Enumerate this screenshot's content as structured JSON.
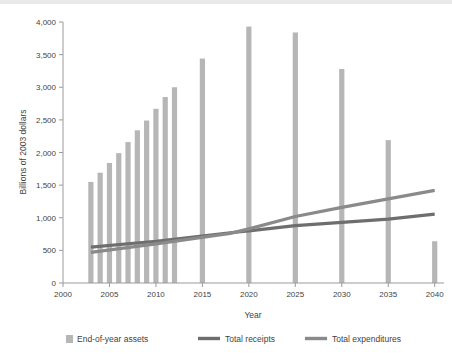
{
  "chart_data": {
    "type": "bar",
    "title": "",
    "xlabel": "Year",
    "ylabel": "Billions of 2003 dollars",
    "xlim": [
      2000,
      2041
    ],
    "ylim": [
      0,
      4000
    ],
    "grid": false,
    "legend_position": "bottom",
    "x_ticks": [
      "2000",
      "2005",
      "2010",
      "2015",
      "2020",
      "2025",
      "2030",
      "2035",
      "2040"
    ],
    "x_tick_values": [
      2000,
      2005,
      2010,
      2015,
      2020,
      2025,
      2030,
      2035,
      2040
    ],
    "y_ticks": [
      "0",
      "500",
      "1,000",
      "1,500",
      "2,000",
      "2,500",
      "3,000",
      "3,500",
      "4,000"
    ],
    "y_tick_values": [
      0,
      500,
      1000,
      1500,
      2000,
      2500,
      3000,
      3500,
      4000
    ],
    "series": [
      {
        "name": "End-of-year assets",
        "type": "bar",
        "color": "#b6b6b6",
        "x": [
          2003,
          2004,
          2005,
          2006,
          2007,
          2008,
          2009,
          2010,
          2011,
          2012,
          2015,
          2020,
          2025,
          2030,
          2035,
          2040
        ],
        "values": [
          1550,
          1690,
          1840,
          1990,
          2160,
          2340,
          2490,
          2670,
          2850,
          3000,
          3440,
          3930,
          3840,
          3280,
          2190,
          640
        ]
      },
      {
        "name": "Total receipts",
        "type": "line",
        "color": "#6e6e6e",
        "x": [
          2003,
          2010,
          2018,
          2020,
          2025,
          2030,
          2035,
          2040
        ],
        "values": [
          550,
          640,
          770,
          800,
          880,
          930,
          980,
          1055
        ]
      },
      {
        "name": "Total expenditures",
        "type": "line",
        "color": "#8a8a8a",
        "x": [
          2003,
          2010,
          2018,
          2020,
          2025,
          2030,
          2035,
          2040
        ],
        "values": [
          470,
          600,
          760,
          830,
          1020,
          1160,
          1290,
          1420
        ]
      }
    ]
  },
  "axes": {
    "x_title": "Year",
    "y_title": "Billions of 2003 dollars"
  },
  "legend": {
    "items": [
      {
        "label": "End-of-year assets",
        "marker": "swatch",
        "color": "#b6b6b6"
      },
      {
        "label": "Total receipts",
        "marker": "line",
        "color": "#6e6e6e"
      },
      {
        "label": "Total expenditures",
        "marker": "line",
        "color": "#8a8a8a"
      }
    ]
  }
}
